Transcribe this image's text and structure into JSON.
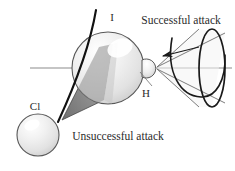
{
  "figure": {
    "name": "reaction-attack-geometry",
    "background": "#ffffff"
  },
  "atoms": {
    "iodine": {
      "label": "I",
      "x": 108,
      "y": 68,
      "r": 36,
      "label_x": 112,
      "label_y": 21
    },
    "hydrogen": {
      "label": "H",
      "x": 148,
      "y": 68,
      "r": 9,
      "label_x": 146,
      "label_y": 97
    },
    "chlorine": {
      "label": "Cl",
      "x": 38,
      "y": 135,
      "r": 21,
      "label_x": 35,
      "label_y": 110
    }
  },
  "annotations": {
    "successful": {
      "text": "Successful attack",
      "x": 181,
      "y": 24
    },
    "unsuccessful": {
      "text": "Unsuccessful attack",
      "x": 118,
      "y": 140
    }
  },
  "colors": {
    "sphere_fill": "#e8e8e8",
    "sphere_edge": "#585858",
    "shaded_cone": "#9a9a9a",
    "dark_cone_edge": "#1a1a1a",
    "axis_line": "#8c8c8c",
    "cone_line": "#6e6e6e",
    "text": "#2b2b2b"
  },
  "geometry": {
    "axis": {
      "x1": 30,
      "y1": 68,
      "x2": 232,
      "y2": 68
    },
    "arrow": {
      "x1": 198,
      "y1": 48,
      "x2": 162,
      "y2": 56,
      "direction": "left"
    },
    "successful_cone": {
      "apex_x": 156,
      "apex_y": 68,
      "base_cx": 212,
      "base_cy": 68,
      "base_rx": 13,
      "base_ry": 39
    },
    "unsuccessful_cone": {
      "apex_x": 60,
      "apex_y": 118,
      "base_cx": 108,
      "base_cy": 62
    }
  }
}
